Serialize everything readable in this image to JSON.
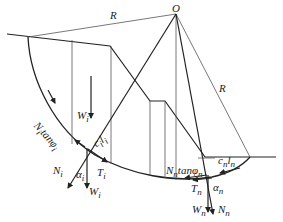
{
  "diagram": {
    "type": "slope stability slice method (circular slip surface)",
    "labels": {
      "center": "O",
      "radius_top": "R",
      "radius_right": "R",
      "weight_slice_i": "W",
      "weight_slice_i_sub": "i",
      "friction_i": "N",
      "friction_i_sub": "i",
      "friction_i_tan": "tanφ",
      "friction_i_tan_sub": "i",
      "cohesion_i": "c",
      "cohesion_i_sub": "i",
      "cohesion_i_l": "l",
      "cohesion_i_l_sub": "i",
      "normal_i": "N",
      "normal_i_sub": "i",
      "alpha_i": "α",
      "alpha_i_sub": "i",
      "shear_i": "T",
      "shear_i_sub": "i",
      "weight_vec_i": "W",
      "weight_vec_i_sub": "i",
      "friction_n": "N",
      "friction_n_sub": "n",
      "friction_n_tan": "tanφ",
      "friction_n_tan_sub": "n",
      "cohesion_n": "c",
      "cohesion_n_sub": "n",
      "cohesion_n_l": "l",
      "cohesion_n_l_sub": "n",
      "shear_n": "T",
      "shear_n_sub": "n",
      "alpha_n": "α",
      "alpha_n_sub": "n",
      "weight_n": "W",
      "weight_n_sub": "n",
      "normal_n": "N",
      "normal_n_sub": "n"
    },
    "colors": {
      "line": "#222222",
      "thin_line": "#555555",
      "background": "#ffffff"
    }
  }
}
